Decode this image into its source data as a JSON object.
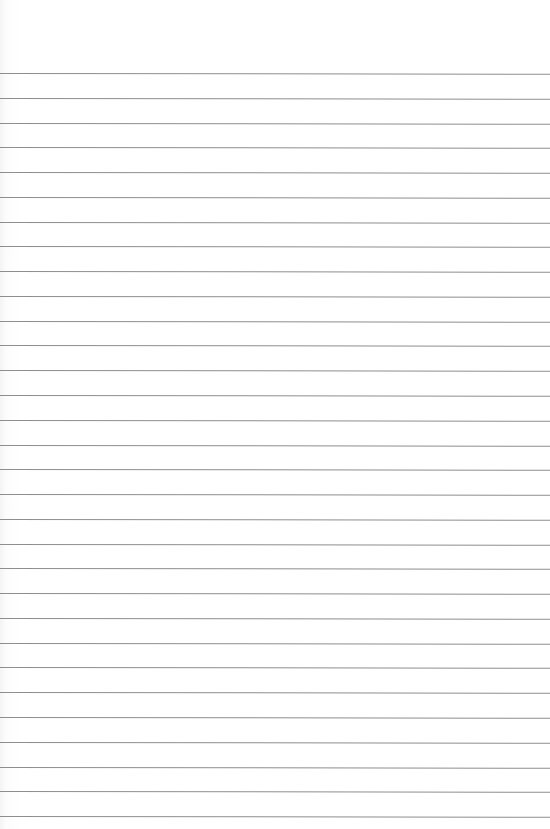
{
  "paper": {
    "type": "blank ruled sheet",
    "line_color": "#8e8e8e",
    "background_color": "#ffffff",
    "first_line_y": 73,
    "line_spacing": 24.77,
    "line_count": 31
  }
}
